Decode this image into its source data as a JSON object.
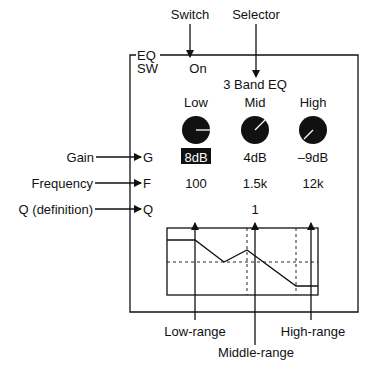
{
  "callouts": {
    "switch": "Switch",
    "selector": "Selector",
    "gain": "Gain",
    "frequency": "Frequency",
    "q": "Q (definition)",
    "low_range": "Low-range",
    "middle_range": "Middle-range",
    "high_range": "High-range"
  },
  "panel": {
    "title_line1": "EQ",
    "title_line2": "SW",
    "switch_value": "On",
    "mode": "3 Band EQ",
    "row_labels": {
      "gain": "G",
      "frequency": "F",
      "q": "Q"
    },
    "bands": [
      {
        "name": "Low",
        "gain": "8dB",
        "frequency": "100",
        "selected_gain": true
      },
      {
        "name": "Mid",
        "gain": "4dB",
        "frequency": "1.5k",
        "selected_gain": false
      },
      {
        "name": "High",
        "gain": "–9dB",
        "frequency": "12k",
        "selected_gain": false
      }
    ],
    "q_value": "1"
  },
  "colors": {
    "ink": "#111111",
    "background": "#ffffff",
    "highlight_bg": "#111111",
    "highlight_fg": "#ffffff"
  }
}
